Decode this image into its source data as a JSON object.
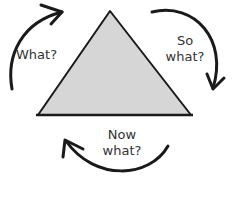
{
  "diagram": {
    "type": "reflective-cycle",
    "labels": {
      "what": "What?",
      "so_what_line1": "So",
      "so_what_line2": "what?",
      "now_what_line1": "Now",
      "now_what_line2": "what?"
    },
    "colors": {
      "triangle_fill": "#d6d6d6",
      "stroke": "#1a1a1a",
      "text": "#333333",
      "background": "#ffffff"
    },
    "arrows": [
      {
        "from": "what",
        "to": "so_what",
        "direction": "clockwise",
        "position": "top-left"
      },
      {
        "from": "so_what",
        "to": "now_what",
        "direction": "clockwise",
        "position": "right"
      },
      {
        "from": "now_what",
        "to": "what",
        "direction": "clockwise",
        "position": "bottom"
      }
    ]
  }
}
